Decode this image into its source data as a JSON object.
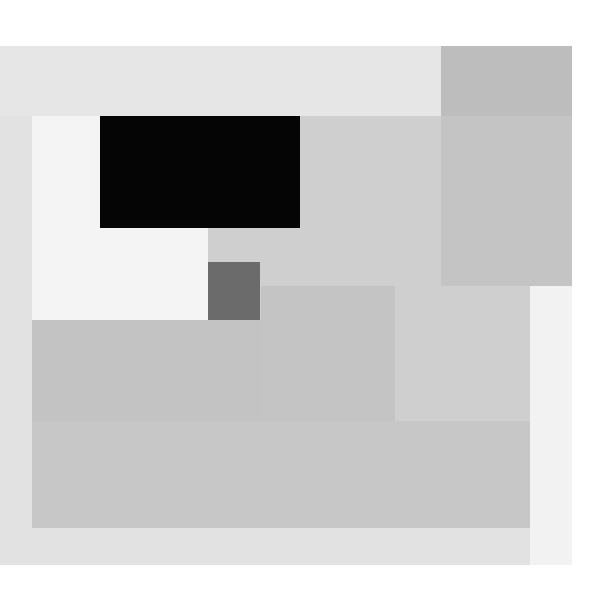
{
  "artwork": {
    "type": "abstract geometric composition",
    "palette": {
      "ground": "#e2e2e2",
      "top_band": "#e6e6e6",
      "top_right_block": "#bdbdbd",
      "white_panel": "#f4f4f4",
      "black_rect": "#050505",
      "mid_grey_field": "#cfcfcf",
      "dark_square": "#6b6b6b",
      "center_square": "#c4c4c4",
      "lower_left_slab": "#c3c3c3",
      "lower_slab": "#c7c7c7",
      "right_white_patch": "#f2f2f2"
    }
  }
}
